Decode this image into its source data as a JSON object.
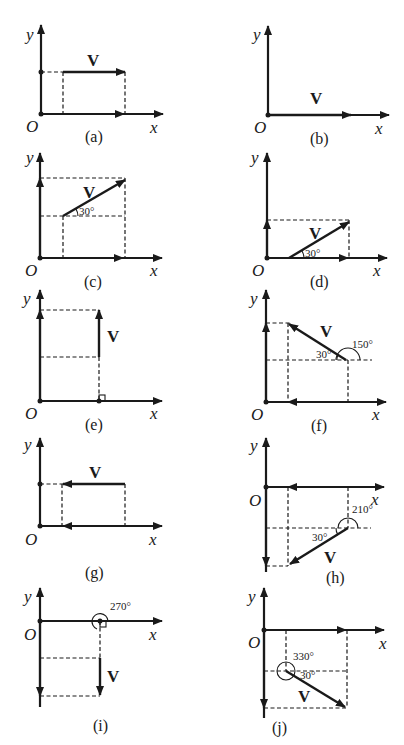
{
  "figure": {
    "axis_labels": {
      "x": "x",
      "y": "y",
      "origin": "O"
    },
    "vector_label": "V",
    "panels": [
      {
        "id": "a",
        "caption": "(a)",
        "description": "V parallel to x-axis, in first quadrant, pointing right; components along axes"
      },
      {
        "id": "b",
        "caption": "(b)",
        "description": "V lying along x-axis, pointing right"
      },
      {
        "id": "c",
        "caption": "(c)",
        "description": "V at 30° above horizontal, first quadrant",
        "angle_label": "30°"
      },
      {
        "id": "d",
        "caption": "(d)",
        "description": "V starting on x-axis at 30°",
        "angle_label": "30°"
      },
      {
        "id": "e",
        "caption": "(e)",
        "description": "V vertical pointing up from x-axis, right angle marker"
      },
      {
        "id": "f",
        "caption": "(f)",
        "description": "V at 150° direction",
        "angle_labels": [
          "30°",
          "150°"
        ]
      },
      {
        "id": "g",
        "caption": "(g)",
        "description": "V parallel to x-axis pointing left"
      },
      {
        "id": "h",
        "caption": "(h)",
        "description": "V at 210° direction, fourth-quadrant region",
        "angle_labels": [
          "30°",
          "210°"
        ]
      },
      {
        "id": "i",
        "caption": "(i)",
        "description": "V vertical pointing down from x-axis, 270°",
        "angle_label": "270°"
      },
      {
        "id": "j",
        "caption": "(j)",
        "description": "V at 330° direction",
        "angle_labels": [
          "330°",
          "30°"
        ]
      }
    ]
  }
}
